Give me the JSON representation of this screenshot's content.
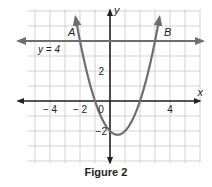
{
  "figure": {
    "caption": "Figure 2",
    "colors": {
      "grid": "#c8c8c8",
      "axis": "#222222",
      "curve": "#6e6e6e",
      "line": "#6e6e6e",
      "text": "#222222"
    }
  },
  "chart_data": {
    "type": "line",
    "title": "Figure 2",
    "xlabel": "x",
    "ylabel": "y",
    "xlim": [
      -5.9,
      6
    ],
    "ylim": [
      -4,
      6.1
    ],
    "grid": true,
    "x_tick_labels": [
      "-4",
      "-2",
      "0",
      "4"
    ],
    "y_tick_labels": [
      "2",
      "-2"
    ],
    "series": [
      {
        "name": "parabola",
        "equation": "y = x^2 - x - 2",
        "x": [
          -2.3,
          -2,
          -1.5,
          -1,
          -0.5,
          0,
          0.5,
          1,
          1.5,
          2,
          2.5,
          3,
          3.3
        ],
        "y": [
          5.59,
          4,
          1.75,
          0,
          -1.25,
          -2,
          -2.25,
          -2,
          -1.25,
          0,
          1.75,
          4,
          5.59
        ]
      },
      {
        "name": "y = 4",
        "equation": "y = 4",
        "x": [
          -5.9,
          6
        ],
        "y": [
          4,
          4
        ]
      }
    ],
    "annotations": [
      {
        "text": "A",
        "x": -2,
        "y": 4,
        "note": "intersection point"
      },
      {
        "text": "B",
        "x": 3,
        "y": 4,
        "note": "intersection point"
      },
      {
        "text": "y = 4",
        "x": -4.5,
        "y": 3.3,
        "note": "line label"
      }
    ]
  }
}
